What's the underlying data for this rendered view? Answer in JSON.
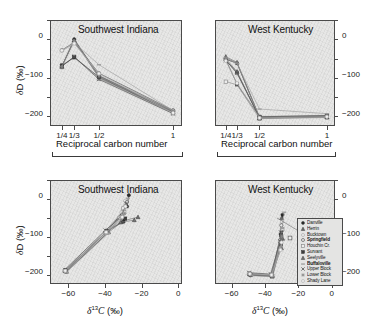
{
  "figure": {
    "panels": [
      {
        "id": "top-left",
        "title": "Southwest Indiana",
        "xlabel": "Reciprocal carbon number",
        "ylabel": "δD (‰)",
        "ylabel_side": "left"
      },
      {
        "id": "top-right",
        "title": "West Kentucky",
        "xlabel": "Reciprocal carbon number",
        "ylabel": "",
        "ylabel_side": "right"
      },
      {
        "id": "bottom-left",
        "title": "Southwest Indiana",
        "xlabel": "δ C (‰)",
        "xlabel_sup": "13",
        "ylabel": "δD (‰)",
        "ylabel_side": "left"
      },
      {
        "id": "bottom-right",
        "title": "West Kentucky",
        "xlabel": "δ C (‰)",
        "xlabel_sup": "13",
        "ylabel": "",
        "ylabel_side": "right"
      }
    ],
    "axes": {
      "recip_xticks": [
        "1/4",
        "1/3",
        "1/2",
        "1"
      ],
      "recip_xvalues": [
        0.25,
        0.3333,
        0.5,
        1.0
      ],
      "d13c_xticks": [
        "−60",
        "−40",
        "−20",
        "0"
      ],
      "d13c_xvalues": [
        -60,
        -40,
        -20,
        0
      ],
      "dD_yticks": [
        "0",
        "−100",
        "−200"
      ],
      "dD_yvalues": [
        0,
        -100,
        -200
      ]
    },
    "legend": {
      "items": [
        {
          "label": "Danville",
          "marker": "circle-filled",
          "bold": false
        },
        {
          "label": "Herrin",
          "marker": "triangle-filled",
          "bold": false
        },
        {
          "label": "Bucktown",
          "marker": "circle-open",
          "bold": false
        },
        {
          "label": "Springfield",
          "marker": "circle-open",
          "bold": true
        },
        {
          "label": "Houchin Cr.",
          "marker": "square-open",
          "bold": false
        },
        {
          "label": "Survant",
          "marker": "square-filled",
          "bold": false
        },
        {
          "label": "Seelyville",
          "marker": "triangle-filled",
          "bold": false
        },
        {
          "label": "Buffaloville",
          "marker": "dash",
          "bold": true
        },
        {
          "label": "Upper Block",
          "marker": "x-mark",
          "bold": false
        },
        {
          "label": "Lower Block",
          "marker": "star",
          "bold": false
        },
        {
          "label": "Shady Lane",
          "marker": "circle-open",
          "bold": false
        }
      ]
    },
    "colors": {
      "plot_background": "#e7e7e6",
      "axis": "#4a4a4a",
      "marker_dark": "#2b2b2b",
      "marker_mid": "#6f6f6f",
      "marker_light": "#a8a8a8",
      "line": "#8a8a8a",
      "text": "#111111"
    }
  },
  "chart_data": [
    {
      "type": "line",
      "panel": "top-left",
      "title": "Southwest Indiana",
      "xlabel": "Reciprocal carbon number",
      "ylabel": "δD (‰)",
      "xlim": [
        0.17,
        1.06
      ],
      "ylim": [
        -235,
        40
      ],
      "x": [
        0.25,
        0.3333,
        0.5,
        1.0
      ],
      "xtick_labels": [
        "1/4",
        "1/3",
        "1/2",
        "1"
      ],
      "grid": false,
      "legend_position": "none",
      "series": [
        {
          "name": "Danville",
          "values": [
            -80,
            -10,
            -105,
            -197
          ]
        },
        {
          "name": "Herrin",
          "values": [
            -82,
            -12,
            -110,
            -200
          ]
        },
        {
          "name": "Bucktown",
          "values": [
            -40,
            -20,
            -100,
            -196
          ]
        },
        {
          "name": "Springfield",
          "values": [
            -38,
            -18,
            -98,
            -194
          ]
        },
        {
          "name": "Houchin Cr.",
          "values": [
            -80,
            -55,
            -112,
            -202
          ]
        },
        {
          "name": "Survant",
          "values": [
            -78,
            -57,
            -108,
            -199
          ]
        },
        {
          "name": "Seelyville",
          "values": [
            -79,
            -14,
            -106,
            -198
          ]
        },
        {
          "name": "Buffaloville",
          "values": [
            -41,
            -19,
            -76,
            -195
          ]
        },
        {
          "name": "Upper Block",
          "values": [
            -80,
            -56,
            -114,
            -203
          ]
        },
        {
          "name": "Lower Block",
          "values": [
            -81,
            -13,
            -104,
            -196
          ]
        },
        {
          "name": "Shady Lane",
          "values": [
            -39,
            -21,
            -99,
            -201
          ]
        }
      ]
    },
    {
      "type": "line",
      "panel": "top-right",
      "title": "West Kentucky",
      "xlabel": "Reciprocal carbon number",
      "ylabel": "δD (‰)",
      "xlim": [
        0.17,
        1.06
      ],
      "ylim": [
        -235,
        40
      ],
      "x": [
        0.25,
        0.3333,
        0.5,
        1.0
      ],
      "xtick_labels": [
        "1/4",
        "1/3",
        "1/2",
        "1"
      ],
      "grid": false,
      "legend_position": "none",
      "series": [
        {
          "name": "Danville",
          "values": [
            -62,
            -72,
            -212,
            -209
          ]
        },
        {
          "name": "Herrin",
          "values": [
            -55,
            -70,
            -214,
            -211
          ]
        },
        {
          "name": "Bucktown",
          "values": [
            -60,
            -95,
            -210,
            -207
          ]
        },
        {
          "name": "Springfield",
          "values": [
            -64,
            -98,
            -213,
            -210
          ]
        },
        {
          "name": "Houchin Cr.",
          "values": [
            -120,
            -128,
            -216,
            -213
          ]
        },
        {
          "name": "Survant",
          "values": [
            -63,
            -126,
            -211,
            -208
          ]
        },
        {
          "name": "Seelyville",
          "values": [
            -61,
            -94,
            -215,
            -212
          ]
        },
        {
          "name": "Buffaloville",
          "values": [
            -58,
            -73,
            -191,
            -203
          ]
        },
        {
          "name": "Upper Block",
          "values": [
            -65,
            -97,
            -213,
            -210
          ]
        },
        {
          "name": "Lower Block",
          "values": [
            -59,
            -71,
            -212,
            -209
          ]
        },
        {
          "name": "Shady Lane",
          "values": [
            -66,
            -124,
            -214,
            -211
          ]
        }
      ]
    },
    {
      "type": "scatter",
      "panel": "bottom-left",
      "title": "Southwest Indiana",
      "xlabel": "δ13C (‰)",
      "ylabel": "δD (‰)",
      "xlim": [
        -70,
        2
      ],
      "ylim": [
        -235,
        40
      ],
      "grid": false,
      "legend_position": "none",
      "series": [
        {
          "name": "Danville",
          "x": [
            -61.5,
            -39,
            -28,
            -27
          ],
          "y": [
            -200,
            -96,
            -30,
            0
          ]
        },
        {
          "name": "Herrin",
          "x": [
            -61.0,
            -38,
            -30,
            -22
          ],
          "y": [
            -202,
            -98,
            -68,
            -58
          ]
        },
        {
          "name": "Bucktown",
          "x": [
            -61.8,
            -39.5,
            -31,
            -29
          ],
          "y": [
            -198,
            -94,
            -45,
            -15
          ]
        },
        {
          "name": "Springfield",
          "x": [
            -61.2,
            -38.5,
            -30.5,
            -28
          ],
          "y": [
            -203,
            -99,
            -52,
            -18
          ]
        },
        {
          "name": "Houchin Cr.",
          "x": [
            -62.0,
            -40,
            -32,
            -30
          ],
          "y": [
            -201,
            -100,
            -60,
            -35
          ]
        },
        {
          "name": "Survant",
          "x": [
            -61.4,
            -38.8,
            -30.2,
            -29
          ],
          "y": [
            -199,
            -95,
            -70,
            -62
          ]
        },
        {
          "name": "Seelyville",
          "x": [
            -61.6,
            -39.2,
            -31.5,
            -24
          ],
          "y": [
            -200,
            -97,
            -72,
            -66
          ]
        },
        {
          "name": "Buffaloville",
          "x": [
            -61.1,
            -38.2,
            -29.5,
            -27.5
          ],
          "y": [
            -204,
            -101,
            -40,
            -8
          ]
        },
        {
          "name": "Upper Block",
          "x": [
            -61.9,
            -39.8,
            -30.8,
            -28.5
          ],
          "y": [
            -197,
            -93,
            -55,
            -22
          ]
        },
        {
          "name": "Lower Block",
          "x": [
            -61.3,
            -38.6,
            -31.2,
            -29.2
          ],
          "y": [
            -202,
            -96,
            -65,
            -48
          ]
        },
        {
          "name": "Shady Lane",
          "x": [
            -61.7,
            -39.4,
            -30.6,
            -28.8
          ],
          "y": [
            -200,
            -98,
            -58,
            -30
          ]
        }
      ]
    },
    {
      "type": "scatter",
      "panel": "bottom-right",
      "title": "West Kentucky",
      "xlabel": "δ13C (‰)",
      "ylabel": "δD (‰)",
      "xlim": [
        -70,
        2
      ],
      "ylim": [
        -235,
        40
      ],
      "grid": false,
      "legend_position": "inside-right",
      "series": [
        {
          "name": "Danville",
          "x": [
            -49,
            -36,
            -30,
            -29.5
          ],
          "y": [
            -208,
            -212,
            -95,
            -52
          ]
        },
        {
          "name": "Herrin",
          "x": [
            -48.5,
            -35.5,
            -30.5,
            -30
          ],
          "y": [
            -210,
            -213,
            -100,
            -60
          ]
        },
        {
          "name": "Bucktown",
          "x": [
            -49.5,
            -36.5,
            -30.2,
            -29.8
          ],
          "y": [
            -206,
            -211,
            -110,
            -70
          ]
        },
        {
          "name": "Springfield",
          "x": [
            -48.8,
            -35.8,
            -30.8,
            -30.2
          ],
          "y": [
            -212,
            -214,
            -118,
            -80
          ]
        },
        {
          "name": "Houchin Cr.",
          "x": [
            -49.2,
            -36.2,
            -30.6,
            -29.6
          ],
          "y": [
            -207,
            -210,
            -125,
            -90
          ]
        },
        {
          "name": "Survant",
          "x": [
            -48.6,
            -35.6,
            -30.4,
            -30.4
          ],
          "y": [
            -211,
            -215,
            -130,
            -105
          ]
        },
        {
          "name": "Seelyville",
          "x": [
            -49.4,
            -36.4,
            -30.1,
            -29.4
          ],
          "y": [
            -209,
            -212,
            -140,
            -115
          ]
        },
        {
          "name": "Buffaloville",
          "x": [
            -48.2,
            -35.2,
            -29.8,
            -28.5
          ],
          "y": [
            -213,
            -216,
            -88,
            -45
          ]
        },
        {
          "name": "Upper Block",
          "x": [
            -49.6,
            -36.6,
            -30.9,
            -30.6
          ],
          "y": [
            -205,
            -209,
            -122,
            -98
          ]
        },
        {
          "name": "Lower Block",
          "x": [
            -48.9,
            -35.9,
            -30.3,
            -29.9
          ],
          "y": [
            -210,
            -213,
            -135,
            -108
          ]
        },
        {
          "name": "Shady Lane",
          "x": [
            -49.1,
            -36.1,
            -30.7,
            -30.1
          ],
          "y": [
            -208,
            -211,
            -145,
            -125
          ]
        }
      ]
    }
  ]
}
